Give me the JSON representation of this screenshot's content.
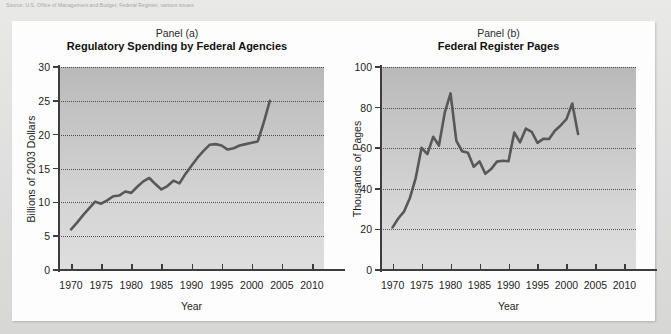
{
  "top_caption": "Source: U.S. Office of Management and Budget; Federal Register, various issues.",
  "panels": [
    {
      "id": "a",
      "sub": "Panel (a)",
      "title": "Regulatory Spending by Federal Agencies",
      "xlabel": "Year",
      "ylabel": "Billions of 2003 Dollars"
    },
    {
      "id": "b",
      "sub": "Panel (b)",
      "title": "Federal Register Pages",
      "xlabel": "Year",
      "ylabel": "Thousands of Pages"
    }
  ],
  "colors": {
    "line": "#585858",
    "axis": "#3d3d3d",
    "grid": "#2f2f2f",
    "plot_bg_top": "#b9b9b9",
    "plot_bg_bottom": "#dedede",
    "card_bg": "#fdfdfd",
    "page_bg": "#e3e3e1"
  },
  "chart_data": [
    {
      "type": "line",
      "title": "Regulatory Spending by Federal Agencies",
      "subtitle": "Panel (a)",
      "xlabel": "Year",
      "ylabel": "Billions of 2003 Dollars",
      "xlim": [
        1968,
        2012
      ],
      "ylim": [
        0,
        30
      ],
      "xticks": [
        1970,
        1975,
        1980,
        1985,
        1990,
        1995,
        2000,
        2005,
        2010
      ],
      "yticks": [
        0,
        5,
        10,
        15,
        20,
        25,
        30
      ],
      "grid": true,
      "legend": "none",
      "x": [
        1970,
        1971,
        1972,
        1973,
        1974,
        1975,
        1976,
        1977,
        1978,
        1979,
        1980,
        1981,
        1982,
        1983,
        1984,
        1985,
        1986,
        1987,
        1988,
        1989,
        1990,
        1991,
        1992,
        1993,
        1994,
        1995,
        1996,
        1997,
        1998,
        1999,
        2000,
        2001,
        2002,
        2003
      ],
      "values": [
        6.0,
        7.0,
        8.1,
        9.1,
        10.1,
        9.8,
        10.3,
        10.9,
        11.0,
        11.6,
        11.4,
        12.3,
        13.1,
        13.6,
        12.7,
        11.9,
        12.4,
        13.2,
        12.8,
        14.2,
        15.4,
        16.6,
        17.6,
        18.5,
        18.6,
        18.4,
        17.8,
        18.0,
        18.4,
        18.6,
        18.8,
        19.0,
        21.8,
        25.0
      ]
    },
    {
      "type": "line",
      "title": "Federal Register Pages",
      "subtitle": "Panel (b)",
      "xlabel": "Year",
      "ylabel": "Thousands of Pages",
      "xlim": [
        1968,
        2012
      ],
      "ylim": [
        0,
        100
      ],
      "xticks": [
        1970,
        1975,
        1980,
        1985,
        1990,
        1995,
        2000,
        2005,
        2010
      ],
      "yticks": [
        0,
        20,
        40,
        60,
        80,
        100
      ],
      "grid": true,
      "legend": "none",
      "x": [
        1970,
        1971,
        1972,
        1973,
        1974,
        1975,
        1976,
        1977,
        1978,
        1979,
        1980,
        1981,
        1982,
        1983,
        1984,
        1985,
        1986,
        1987,
        1988,
        1989,
        1990,
        1991,
        1992,
        1993,
        1994,
        1995,
        1996,
        1997,
        1998,
        1999,
        2000,
        2001,
        2002
      ],
      "values": [
        21.0,
        25.5,
        28.9,
        35.6,
        45.4,
        60.2,
        57.1,
        65.6,
        61.3,
        77.5,
        87.0,
        63.6,
        58.5,
        57.7,
        50.9,
        53.5,
        47.4,
        49.7,
        53.4,
        53.8,
        53.6,
        67.7,
        62.9,
        69.7,
        68.1,
        62.6,
        64.6,
        64.5,
        68.6,
        71.2,
        74.3,
        82.0,
        67.0
      ]
    }
  ]
}
